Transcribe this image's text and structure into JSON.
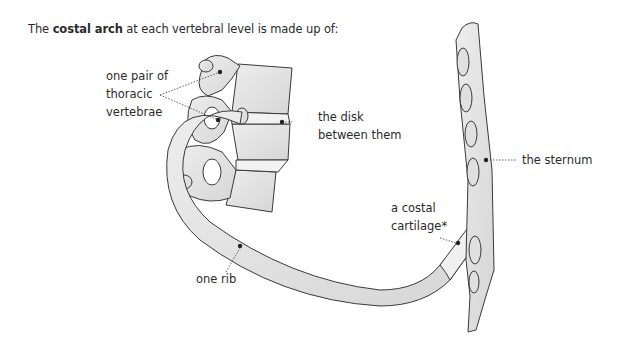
{
  "title": {
    "prefix": "The ",
    "bold": "costal arch",
    "suffix": " at each vertebral level is made up of:"
  },
  "labels": {
    "vertebrae_line1": "one pair of",
    "vertebrae_line2": "thoracic",
    "vertebrae_line3": "vertebrae",
    "disk_line1": "the disk",
    "disk_line2": "between them",
    "sternum": "the sternum",
    "cartilage_line1": "a costal",
    "cartilage_line2": "cartilage*",
    "rib": "one rib"
  },
  "colors": {
    "bone_fill": "#e6e6e6",
    "bone_shadow": "#cfcfcf",
    "outline": "#3a3a3a",
    "text": "#2b2b2b",
    "dot": "#222222"
  }
}
